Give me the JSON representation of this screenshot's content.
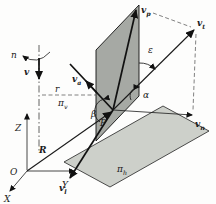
{
  "figure": {
    "axes": {
      "z": "Z",
      "o": "O",
      "y": "Y",
      "x": "X"
    },
    "axis_top": {
      "rotation": "n",
      "velocity": "v",
      "radius": "r"
    },
    "position_vector": "R",
    "point": "P",
    "planes": {
      "vertical": {
        "base": "π",
        "sub": "v"
      },
      "horizontal": {
        "base": "π",
        "sub": "h"
      }
    },
    "vectors": {
      "vp": {
        "base": "v",
        "sub": "p"
      },
      "vt": {
        "base": "v",
        "sub": "t"
      },
      "vn": {
        "base": "v",
        "sub": "n"
      },
      "vl": {
        "base": "v",
        "sub": "l"
      },
      "va": {
        "base": "v",
        "sub": "a"
      }
    },
    "angles": {
      "alpha": "α",
      "beta": "β",
      "epsilon": "ε"
    },
    "colors": {
      "vertical_plane": "#a6a9a4",
      "horizontal_plane": "#cdd0ca",
      "line": "#1a1a1a"
    }
  }
}
